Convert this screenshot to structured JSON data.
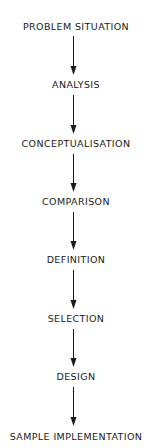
{
  "diagram": {
    "type": "vertical-flowchart",
    "steps": [
      {
        "label": "PROBLEM SITUATION",
        "y": 21
      },
      {
        "label": "ANALYSIS",
        "y": 79
      },
      {
        "label": "CONCEPTUALISATION",
        "y": 138
      },
      {
        "label": "COMPARISON",
        "y": 196
      },
      {
        "label": "DEFINITION",
        "y": 254
      },
      {
        "label": "SELECTION",
        "y": 313
      },
      {
        "label": "DESIGN",
        "y": 371
      },
      {
        "label": "SAMPLE IMPLEMENTATION",
        "y": 431
      }
    ],
    "arrows": [
      {
        "from": "PROBLEM SITUATION",
        "to": "ANALYSIS"
      },
      {
        "from": "ANALYSIS",
        "to": "CONCEPTUALISATION"
      },
      {
        "from": "CONCEPTUALISATION",
        "to": "COMPARISON"
      },
      {
        "from": "COMPARISON",
        "to": "DEFINITION"
      },
      {
        "from": "DEFINITION",
        "to": "SELECTION"
      },
      {
        "from": "SELECTION",
        "to": "DESIGN"
      },
      {
        "from": "DESIGN",
        "to": "SAMPLE IMPLEMENTATION"
      }
    ],
    "colors": {
      "ink": "#1a1a1a",
      "background": "#ffffff"
    }
  }
}
